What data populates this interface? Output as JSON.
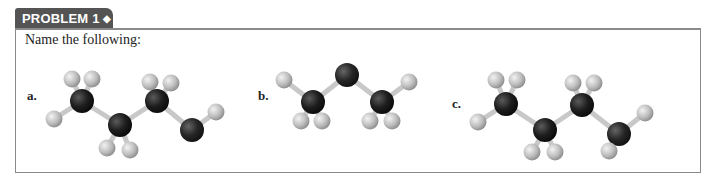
{
  "header": {
    "tab_label": "PROBLEM 1",
    "tab_marker": "◆"
  },
  "prompt": "Name the following:",
  "colors": {
    "tab_bg": "#545454",
    "border": "#8a8a8a",
    "carbon": "#1c1c1c",
    "hydrogen": "#b8b8b8",
    "heteroatom": "#2a2a2a",
    "bond": "#c8c8c8"
  },
  "molecules": [
    {
      "label": "a.",
      "description": "ball-and-stick model: 3 carbons chain ending in O-H",
      "atoms": [
        {
          "el": "H",
          "x": 72,
          "y": 79
        },
        {
          "el": "H",
          "x": 92,
          "y": 79
        },
        {
          "el": "C",
          "x": 82,
          "y": 101
        },
        {
          "el": "H",
          "x": 54,
          "y": 119
        },
        {
          "el": "C",
          "x": 120,
          "y": 125
        },
        {
          "el": "H",
          "x": 107,
          "y": 148
        },
        {
          "el": "H",
          "x": 130,
          "y": 150
        },
        {
          "el": "H",
          "x": 150,
          "y": 82
        },
        {
          "el": "H",
          "x": 171,
          "y": 83
        },
        {
          "el": "C",
          "x": 157,
          "y": 101
        },
        {
          "el": "O",
          "x": 192,
          "y": 130
        },
        {
          "el": "H",
          "x": 216,
          "y": 112
        }
      ]
    },
    {
      "label": "b.",
      "description": "ball-and-stick model: CH3-O-CH3",
      "atoms": [
        {
          "el": "H",
          "x": 284,
          "y": 80
        },
        {
          "el": "C",
          "x": 313,
          "y": 102
        },
        {
          "el": "H",
          "x": 301,
          "y": 121
        },
        {
          "el": "H",
          "x": 322,
          "y": 121
        },
        {
          "el": "O",
          "x": 347,
          "y": 75
        },
        {
          "el": "C",
          "x": 382,
          "y": 102
        },
        {
          "el": "H",
          "x": 370,
          "y": 121
        },
        {
          "el": "H",
          "x": 392,
          "y": 121
        },
        {
          "el": "H",
          "x": 409,
          "y": 82
        }
      ]
    },
    {
      "label": "c.",
      "description": "ball-and-stick model: 3 carbons chain ending in N-H2",
      "atoms": [
        {
          "el": "H",
          "x": 496,
          "y": 80
        },
        {
          "el": "H",
          "x": 517,
          "y": 80
        },
        {
          "el": "C",
          "x": 506,
          "y": 104
        },
        {
          "el": "H",
          "x": 478,
          "y": 122
        },
        {
          "el": "C",
          "x": 545,
          "y": 130
        },
        {
          "el": "H",
          "x": 532,
          "y": 152
        },
        {
          "el": "H",
          "x": 555,
          "y": 152
        },
        {
          "el": "H",
          "x": 573,
          "y": 83
        },
        {
          "el": "H",
          "x": 594,
          "y": 83
        },
        {
          "el": "C",
          "x": 582,
          "y": 105
        },
        {
          "el": "N",
          "x": 619,
          "y": 134
        },
        {
          "el": "H",
          "x": 645,
          "y": 113
        },
        {
          "el": "H",
          "x": 609,
          "y": 151
        }
      ]
    }
  ]
}
